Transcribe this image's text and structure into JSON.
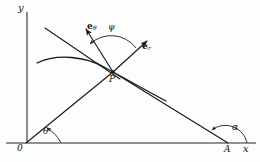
{
  "figure": {
    "domain": "diagram",
    "kind": "polar-coordinate-geometry-diagram",
    "width": 260,
    "height": 162,
    "background_color": "#fdfdfd",
    "ink_color": "#1a1a1a"
  },
  "axes": {
    "y_label": "y",
    "x_label": "x",
    "origin_label": "0",
    "y_axis": {
      "x": 27,
      "y_top": 12,
      "y_bottom": 143
    },
    "x_axis": {
      "y": 143,
      "x_left": 6,
      "x_right": 256
    }
  },
  "points": [
    {
      "name": "origin",
      "label": "0",
      "x": 26,
      "y": 143
    },
    {
      "name": "point-p",
      "label": "P",
      "x": 113,
      "y": 72
    },
    {
      "name": "point-a",
      "label": "A",
      "x": 228,
      "y": 143
    }
  ],
  "angles": [
    {
      "name": "theta",
      "label": "θ",
      "at": "origin",
      "label_x": 43,
      "label_y": 130
    },
    {
      "name": "psi",
      "label": "ψ",
      "at": "point-p",
      "label_x": 109,
      "label_y": 27
    },
    {
      "name": "alpha",
      "label": "α",
      "at": "point-a",
      "label_x": 233,
      "label_y": 126
    }
  ],
  "vectors": [
    {
      "name": "e-theta",
      "base": "e",
      "subscript": "θ",
      "label_x": 88,
      "label_y": 26,
      "tail": {
        "x": 113,
        "y": 72
      },
      "tip": {
        "x": 84,
        "y": 27
      }
    },
    {
      "name": "e-r",
      "base": "e",
      "subscript": "r",
      "label_x": 143,
      "label_y": 46,
      "tail": {
        "x": 113,
        "y": 72
      },
      "tip": {
        "x": 149,
        "y": 39
      }
    }
  ],
  "curves": [
    {
      "name": "trajectory-curve",
      "description": "curve passing through P, arcing from upper-left and descending to lower-right"
    },
    {
      "name": "radius-vector-op",
      "description": "straight ray from origin O through P continuing as e_r direction"
    },
    {
      "name": "chord-pa",
      "description": "straight line from P down to point A on the x-axis"
    },
    {
      "name": "tangent-line",
      "description": "straight line through P extending to the upper-left"
    }
  ]
}
